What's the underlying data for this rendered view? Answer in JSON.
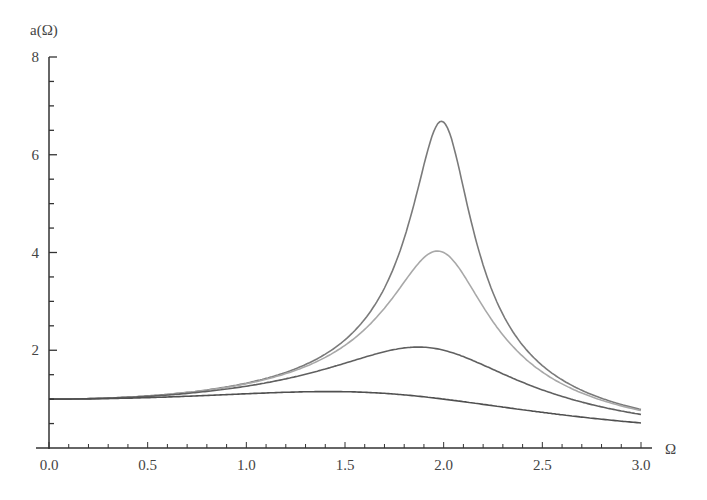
{
  "chart_data": {
    "type": "line",
    "title": "",
    "xlabel": "Ω",
    "ylabel": "a(Ω)",
    "xlim": [
      0,
      3.0
    ],
    "ylim": [
      0,
      8
    ],
    "grid": false,
    "legend": null,
    "x_ticks": [
      "0.0",
      "0.5",
      "1.0",
      "1.5",
      "2.0",
      "2.5",
      "3.0"
    ],
    "y_ticks": [
      "2",
      "4",
      "6",
      "8"
    ],
    "x": [
      0.0,
      0.25,
      0.5,
      0.75,
      1.0,
      1.25,
      1.5,
      1.75,
      2.0,
      2.25,
      2.5,
      2.75,
      3.0
    ],
    "series": [
      {
        "name": "curve-1",
        "color": "#7a7a7a",
        "zeta": 0.075,
        "peak": {
          "x": 1.98,
          "y": 6.7
        },
        "values": [
          1.0,
          1.02,
          1.07,
          1.16,
          1.33,
          1.64,
          2.27,
          3.98,
          6.67,
          3.45,
          1.76,
          1.12,
          0.79
        ]
      },
      {
        "name": "curve-2",
        "color": "#a8a8a8",
        "zeta": 0.125,
        "peak": {
          "x": 1.97,
          "y": 4.05
        },
        "values": [
          1.0,
          1.02,
          1.07,
          1.16,
          1.32,
          1.62,
          2.19,
          3.35,
          4.0,
          2.86,
          1.7,
          1.11,
          0.79
        ]
      },
      {
        "name": "curve-3",
        "color": "#606060",
        "zeta": 0.25,
        "peak": {
          "x": 1.87,
          "y": 2.07
        },
        "values": [
          1.0,
          1.01,
          1.05,
          1.13,
          1.26,
          1.44,
          1.71,
          1.99,
          2.0,
          1.68,
          1.37,
          1.04,
          0.76
        ]
      },
      {
        "name": "curve-4",
        "color": "#505050",
        "zeta": 0.5,
        "peak": {
          "x": 1.44,
          "y": 1.17
        },
        "values": [
          1.0,
          1.0,
          1.02,
          1.06,
          1.11,
          1.15,
          1.16,
          1.14,
          1.0,
          0.87,
          0.73,
          0.62,
          0.51
        ]
      }
    ]
  },
  "axes": {
    "xlabel": "Ω",
    "ylabel": "a(Ω)"
  }
}
